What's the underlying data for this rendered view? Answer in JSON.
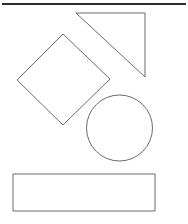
{
  "canvas": {
    "width": 188,
    "height": 224,
    "background_color": "#ffffff",
    "title": "Geometric shapes line drawing"
  },
  "style": {
    "shape_stroke_color": "#6b6b6b",
    "shape_stroke_width": 1,
    "shape_fill": "none",
    "rule_stroke_color": "#2b2b2b",
    "rule_stroke_width": 2
  },
  "separator": {
    "name": "top-horizontal-rule",
    "x1": 2,
    "y1": 4,
    "x2": 186,
    "y2": 4
  },
  "shapes": [
    {
      "id": "triangle",
      "label": "Right triangle",
      "type": "polygon",
      "points": "76,13 145,13 145,77",
      "bbox": {
        "x": 76,
        "y": 13,
        "width": 69,
        "height": 64
      }
    },
    {
      "id": "diamond",
      "label": "Rotated square (diamond)",
      "type": "polygon",
      "points": "63,34 110,79 63,125 17,80",
      "bbox": {
        "x": 17,
        "y": 34,
        "width": 93,
        "height": 91
      }
    },
    {
      "id": "circle",
      "label": "Circle",
      "type": "circle",
      "cx": 119.5,
      "cy": 128,
      "r": 33,
      "bbox": {
        "x": 86,
        "y": 95,
        "width": 67,
        "height": 66
      }
    },
    {
      "id": "rectangle",
      "label": "Rectangle",
      "type": "rect",
      "x": 13,
      "y": 174,
      "width": 142,
      "height": 37,
      "bbox": {
        "x": 13,
        "y": 174,
        "width": 142,
        "height": 37
      }
    }
  ]
}
